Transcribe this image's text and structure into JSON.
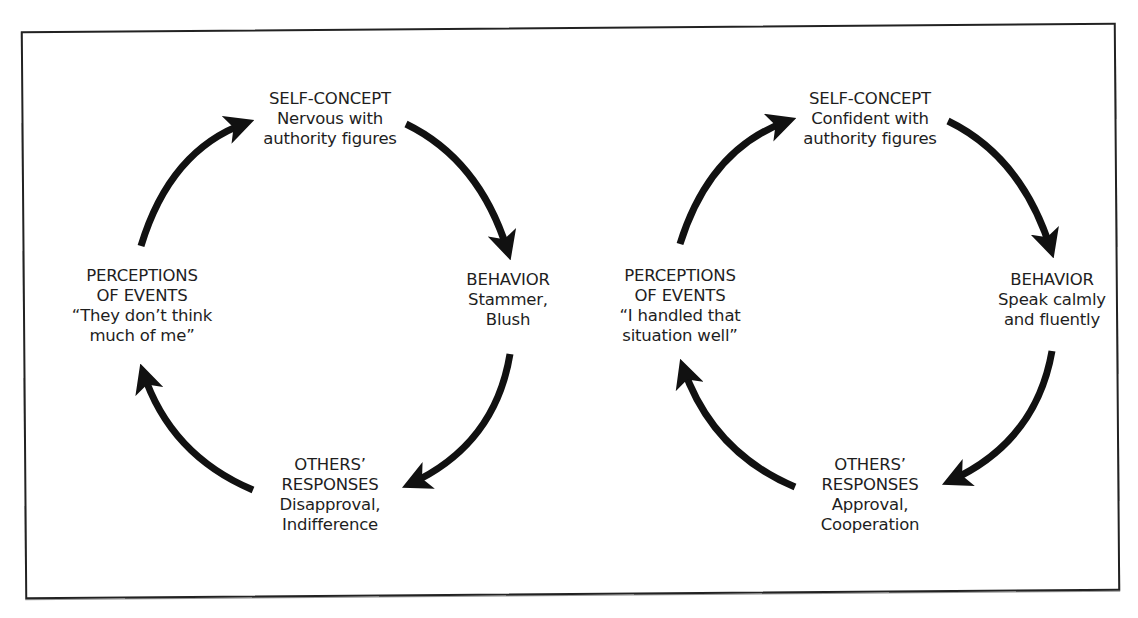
{
  "figure": {
    "frame": {
      "stroke_color": "#222222",
      "background": "#ffffff"
    },
    "arrow_color": "#111111",
    "cycles": [
      {
        "id": "negative",
        "nodes": {
          "self_concept": {
            "heading": "SELF-CONCEPT",
            "lines": [
              "Nervous with",
              "authority figures"
            ]
          },
          "behavior": {
            "heading": "BEHAVIOR",
            "lines": [
              "Stammer,",
              "Blush"
            ]
          },
          "others_responses": {
            "heading_lines": [
              "OTHERS’",
              "RESPONSES"
            ],
            "lines": [
              "Disapproval,",
              "Indifference"
            ]
          },
          "perceptions": {
            "heading_lines": [
              "PERCEPTIONS",
              "OF EVENTS"
            ],
            "lines": [
              "“They don’t think",
              "much of me”"
            ]
          }
        }
      },
      {
        "id": "positive",
        "nodes": {
          "self_concept": {
            "heading": "SELF-CONCEPT",
            "lines": [
              "Confident with",
              "authority figures"
            ]
          },
          "behavior": {
            "heading": "BEHAVIOR",
            "lines": [
              "Speak calmly",
              "and fluently"
            ]
          },
          "others_responses": {
            "heading_lines": [
              "OTHERS’",
              "RESPONSES"
            ],
            "lines": [
              "Approval,",
              "Cooperation"
            ]
          },
          "perceptions": {
            "heading_lines": [
              "PERCEPTIONS",
              "OF EVENTS"
            ],
            "lines": [
              "“I handled that",
              "situation well”"
            ]
          }
        }
      }
    ]
  }
}
